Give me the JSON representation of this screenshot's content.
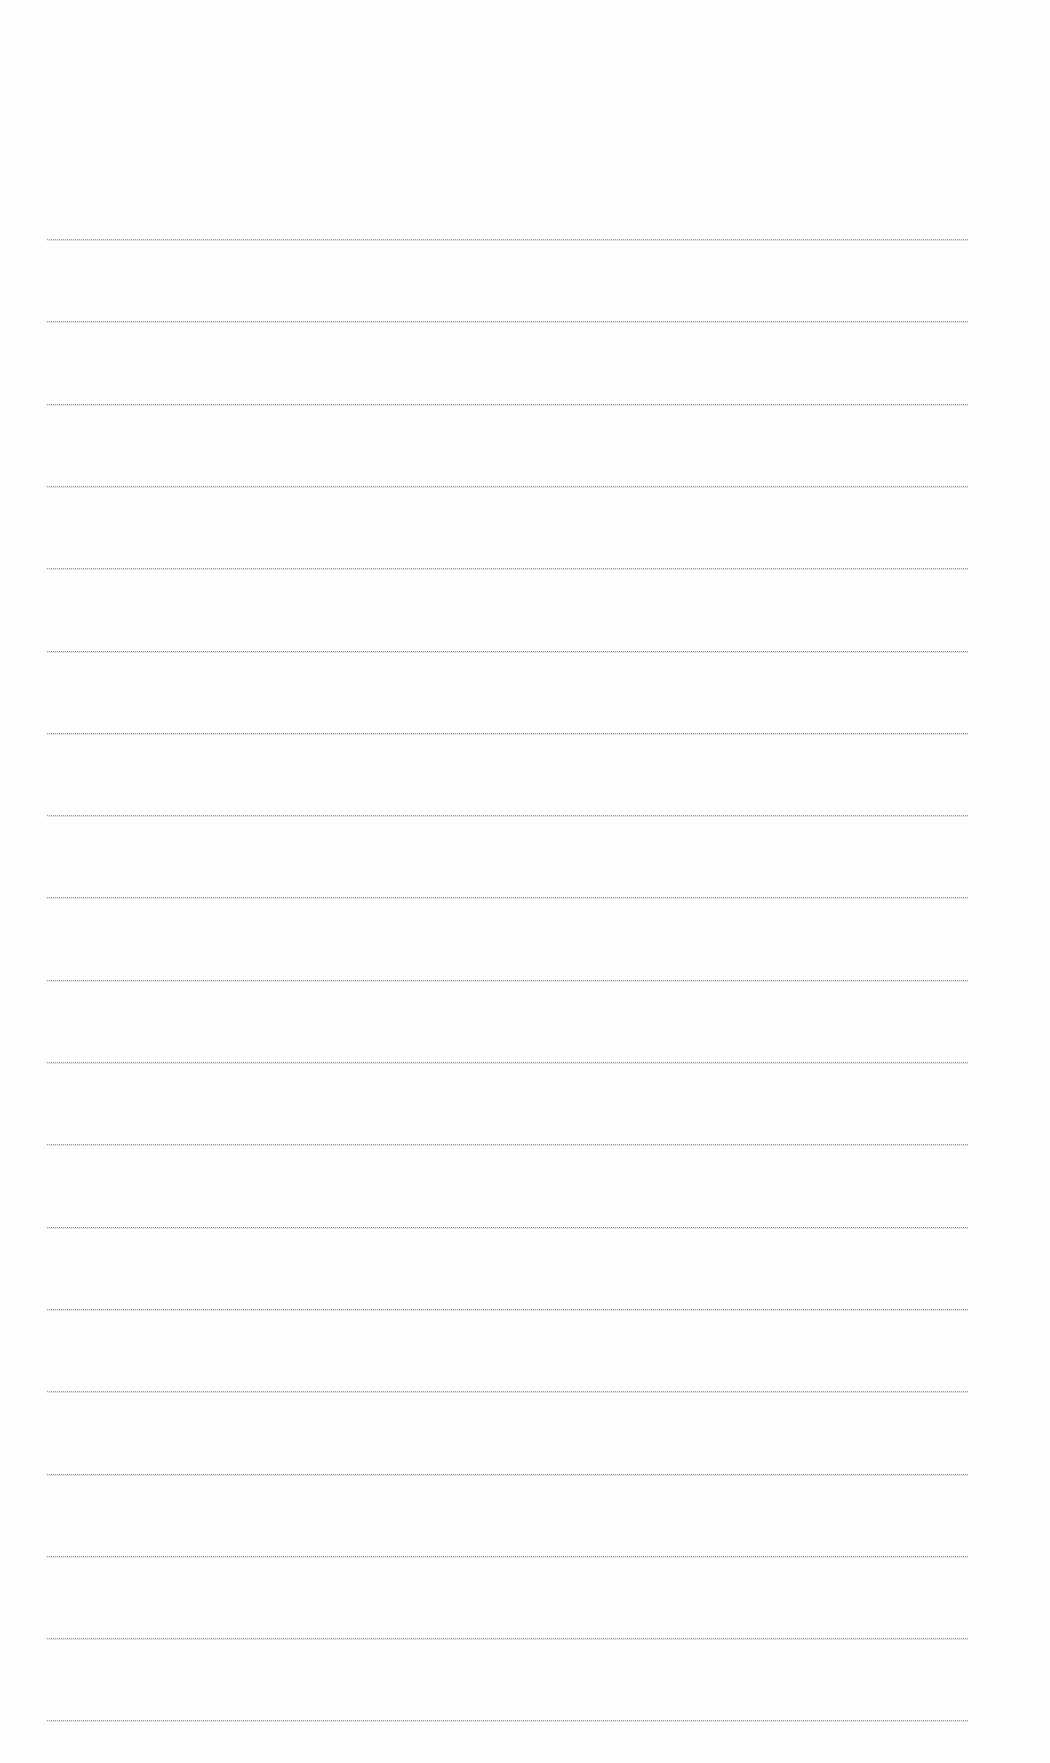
{
  "page": {
    "type": "lined-paper",
    "background_color": "#fefefe",
    "rule_color": "#8f8f8f",
    "rule_count": 19,
    "rule_left_px": 47,
    "rule_right_px": 968,
    "first_rule_y_px": 239,
    "rule_spacing_px": 82.3,
    "text_content": ""
  }
}
